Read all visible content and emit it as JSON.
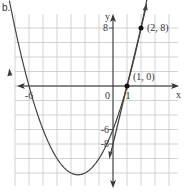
{
  "panel_label": "b.",
  "chart_data": {
    "type": "line",
    "title": "",
    "xlabel": "x",
    "ylabel": "y",
    "xlim": [
      -7,
      4.5
    ],
    "ylim": [
      -14,
      10
    ],
    "grid": true,
    "grid_spacing": {
      "x": 1,
      "y": 2
    },
    "series": [
      {
        "name": "parabola",
        "equation": "y = x^2 + 5x - 6",
        "x_intercepts": [
          -6,
          1
        ],
        "y_intercept": -6,
        "vertex": [
          -2.5,
          -12.25
        ]
      },
      {
        "name": "line",
        "equation": "y = 8x - 8",
        "points": [
          [
            1,
            0
          ],
          [
            2,
            8
          ]
        ],
        "y_intercept": -8
      }
    ],
    "tick_labels": {
      "x": [
        "-6",
        "0",
        "1"
      ],
      "y": [
        "8",
        "-6",
        "-8"
      ]
    },
    "annotations": [
      {
        "text": "(2, 8)",
        "x": 2,
        "y": 8
      },
      {
        "text": "(1, 0)",
        "x": 1,
        "y": 0
      }
    ],
    "colors": {
      "curve": "#444444",
      "grid": "#c8c8c8",
      "axis": "#333333"
    }
  }
}
